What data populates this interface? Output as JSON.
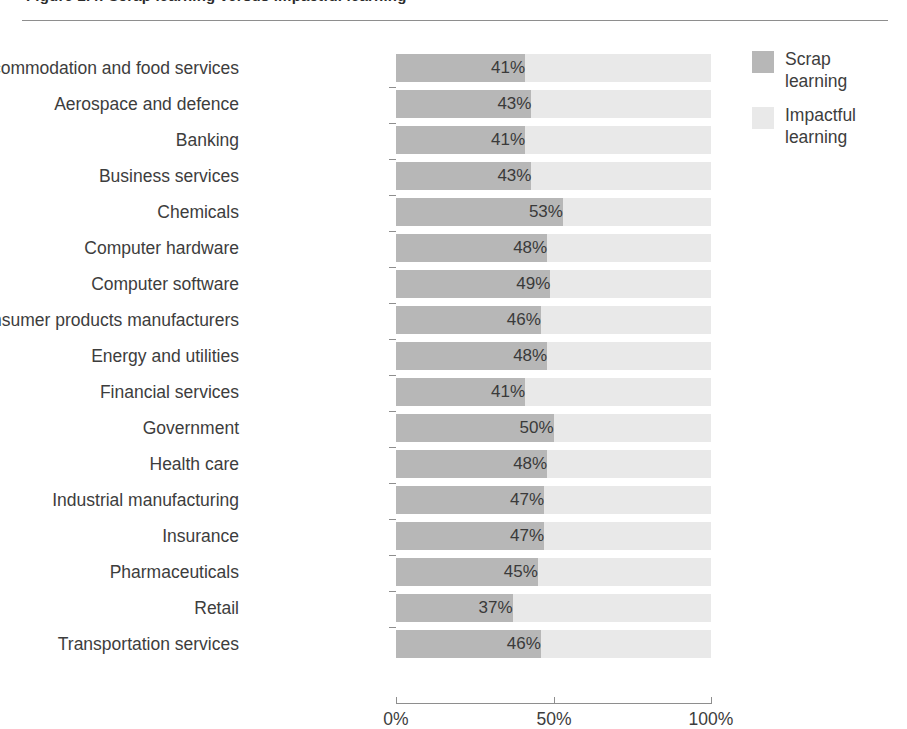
{
  "figure": {
    "title_remnant": "Figure 2.4:  Scrap learning versus impactful learning",
    "has_top_rule": true
  },
  "legend": {
    "position": "right",
    "items": [
      {
        "label": "Scrap learning",
        "color": "#b7b7b7",
        "name": "scrap-learning"
      },
      {
        "label": "Impactful learning",
        "color": "#e9e9e9",
        "name": "impactful-learning"
      }
    ]
  },
  "axis": {
    "ticks": [
      "0%",
      "50%",
      "100%"
    ],
    "tick_values": [
      0,
      50,
      100
    ],
    "min": 0,
    "max": 100
  },
  "chart_data": {
    "type": "bar",
    "orientation": "horizontal",
    "stacked": true,
    "title": "Scrap learning versus impactful learning",
    "xlabel": "",
    "ylabel": "",
    "xlim": [
      0,
      100
    ],
    "grid": false,
    "legend_position": "right",
    "categories": [
      "Accommodation and food services",
      "Aerospace and defence",
      "Banking",
      "Business services",
      "Chemicals",
      "Computer hardware",
      "Computer software",
      "Consumer products manufacturers",
      "Energy and utilities",
      "Financial services",
      "Government",
      "Health care",
      "Industrial manufacturing",
      "Insurance",
      "Pharmaceuticals",
      "Retail",
      "Transportation services"
    ],
    "series": [
      {
        "name": "Scrap learning",
        "color": "#b7b7b7",
        "values": [
          41,
          43,
          41,
          43,
          53,
          48,
          49,
          46,
          48,
          41,
          50,
          48,
          47,
          47,
          45,
          37,
          46
        ],
        "labels": [
          "41%",
          "43%",
          "41%",
          "43%",
          "53%",
          "48%",
          "49%",
          "46%",
          "48%",
          "41%",
          "50%",
          "48%",
          "47%",
          "47%",
          "45%",
          "37%",
          "46%"
        ]
      },
      {
        "name": "Impactful learning",
        "color": "#e9e9e9",
        "values": [
          59,
          57,
          59,
          57,
          47,
          52,
          51,
          54,
          52,
          59,
          50,
          52,
          53,
          53,
          55,
          63,
          54
        ],
        "labels": [
          "",
          "",
          "",
          "",
          "",
          "",
          "",
          "",
          "",
          "",
          "",
          "",
          "",
          "",
          "",
          "",
          ""
        ]
      }
    ]
  }
}
